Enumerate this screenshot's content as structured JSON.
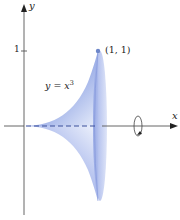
{
  "figure": {
    "axes": {
      "x_label": "x",
      "y_label": "y",
      "y_ticks": [
        {
          "value": 1,
          "label": "1"
        }
      ]
    },
    "curve": {
      "equation_lhs": "y = x",
      "equation_exponent": "3"
    },
    "point": {
      "label": "(1, 1)",
      "x": 1,
      "y": 1
    },
    "rotation": {
      "axis": "x",
      "icon": "rotation-arrow-icon"
    },
    "colors": {
      "solid_fill_dark": "#6f86d6",
      "solid_fill_light": "#dfe6f8",
      "disk_fill": "#a9b8ea",
      "axis": "#555555",
      "point": "#6d86c8",
      "text": "#222222"
    }
  }
}
